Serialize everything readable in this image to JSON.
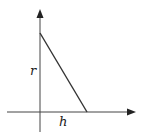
{
  "diagram": {
    "labels": {
      "vertical": "r",
      "horizontal": "h"
    },
    "colors": {
      "stroke": "#333333",
      "background": "#ffffff"
    }
  }
}
